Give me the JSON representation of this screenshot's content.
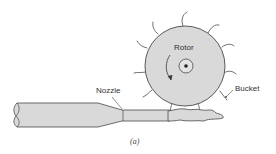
{
  "diagram": {
    "labels": {
      "rotor": "Rotor",
      "nozzle": "Nozzle",
      "bucket": "Bucket"
    },
    "caption": "(a)",
    "colors": {
      "fill": "#d9d9d9",
      "stroke": "#4a4a4a",
      "background": "#ffffff"
    }
  }
}
